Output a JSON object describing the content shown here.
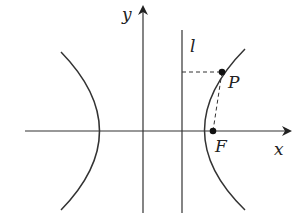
{
  "diagram": {
    "type": "hyperbola-focus-directrix",
    "labels": {
      "y_axis": "y",
      "x_axis": "x",
      "directrix": "l",
      "point": "P",
      "focus": "F"
    },
    "colors": {
      "curve": "#333333",
      "axis": "#333333",
      "background": "#ffffff"
    },
    "elements": [
      "x-axis with arrow",
      "y-axis with arrow",
      "directrix line l (vertical, right of y-axis)",
      "left branch of hyperbola",
      "right branch of hyperbola",
      "point P on right branch",
      "focus F on x-axis",
      "dashed segment from P to directrix (horizontal)",
      "dashed segment from P to F"
    ]
  }
}
